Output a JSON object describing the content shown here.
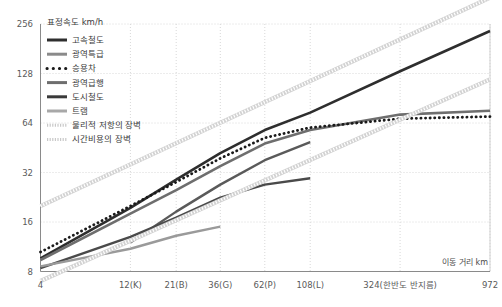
{
  "chart_data": {
    "type": "line",
    "title": "표정속도 km/h",
    "xlabel": "이동 거리 km",
    "ylabel": "표정속도 km/h",
    "xscale": "log",
    "yscale": "log",
    "xlim": [
      4,
      972
    ],
    "ylim": [
      8,
      256
    ],
    "grid": true,
    "legend_position": "top-left",
    "ytick_labels": [
      "256",
      "128",
      "64",
      "32",
      "16",
      "8"
    ],
    "ytick_values": [
      256,
      128,
      64,
      32,
      16,
      8
    ],
    "xtick_labels": [
      "4",
      "12(K)",
      "21(B)",
      "36(G)",
      "62(P)",
      "108(L)",
      "324(한반도 반지름)",
      "972"
    ],
    "xtick_values": [
      4,
      12,
      21,
      36,
      62,
      108,
      324,
      972
    ],
    "series": [
      {
        "name": "고속철도",
        "color": "#2e2e2e",
        "style": "solid",
        "width": 2.6,
        "points": [
          [
            4,
            9.6
          ],
          [
            12,
            19.5
          ],
          [
            21,
            29.0
          ],
          [
            36,
            42.0
          ],
          [
            62,
            58.0
          ],
          [
            108,
            74.0
          ],
          [
            324,
            132.0
          ],
          [
            972,
            232.0
          ]
        ]
      },
      {
        "name": "광역특급",
        "color": "#6e6e6e",
        "style": "solid",
        "width": 2.6,
        "points": [
          [
            4,
            9.4
          ],
          [
            12,
            18.0
          ],
          [
            21,
            25.0
          ],
          [
            36,
            35.0
          ],
          [
            62,
            48.0
          ],
          [
            108,
            58.0
          ],
          [
            324,
            72.0
          ],
          [
            972,
            76.0
          ]
        ]
      },
      {
        "name": "승용차",
        "color": "#1a1a1a",
        "style": "dotted",
        "width": 2.8,
        "points": [
          [
            4,
            10.5
          ],
          [
            12,
            20.0
          ],
          [
            21,
            28.0
          ],
          [
            36,
            39.0
          ],
          [
            62,
            52.0
          ],
          [
            108,
            60.0
          ],
          [
            324,
            68.0
          ],
          [
            972,
            70.0
          ]
        ]
      },
      {
        "name": "광역급행",
        "color": "#5a5a5a",
        "style": "solid",
        "width": 2.4,
        "points": [
          [
            12,
            12.0
          ],
          [
            21,
            18.5
          ],
          [
            36,
            27.0
          ],
          [
            62,
            38.0
          ],
          [
            108,
            49.0
          ]
        ]
      },
      {
        "name": "도시철도",
        "color": "#4a4a4a",
        "style": "solid",
        "width": 2.4,
        "points": [
          [
            4,
            8.4
          ],
          [
            12,
            13.0
          ],
          [
            21,
            17.0
          ],
          [
            36,
            22.5
          ],
          [
            62,
            27.0
          ],
          [
            108,
            29.5
          ]
        ]
      },
      {
        "name": "트램",
        "color": "#9a9a9a",
        "style": "solid",
        "width": 2.4,
        "points": [
          [
            4,
            8.6
          ],
          [
            12,
            11.0
          ],
          [
            21,
            13.2
          ],
          [
            36,
            15.0
          ]
        ]
      },
      {
        "name": "물리적 저항의 장벽",
        "color": "#c8c8c8",
        "style": "hatched",
        "width": 3.0,
        "points": [
          [
            4,
            20.0
          ],
          [
            972,
            370.0
          ]
        ]
      },
      {
        "name": "시간비용의 장벽",
        "color": "#c8c8c8",
        "style": "hatched",
        "width": 3.0,
        "points": [
          [
            4,
            7.0
          ],
          [
            972,
            118.0
          ]
        ]
      }
    ]
  },
  "legend": {
    "title": "표정속도 km/h",
    "items": [
      {
        "label": "고속철도",
        "marker": "thick-dark-line"
      },
      {
        "label": "광역특급",
        "marker": "thick-gray-line"
      },
      {
        "label": "승용차",
        "marker": "dotted-line"
      },
      {
        "label": "광역급행",
        "marker": "thick-gray-line"
      },
      {
        "label": "도시철도",
        "marker": "thick-dark-line"
      },
      {
        "label": "트램",
        "marker": "light-gray-line"
      },
      {
        "label": "물리적 저항의 장벽",
        "marker": "hatched-line"
      },
      {
        "label": "시간비용의 장벽",
        "marker": "hatched-line"
      }
    ]
  },
  "axes": {
    "x_title": "이동 거리 km",
    "y_title": "표정속도 km/h"
  }
}
